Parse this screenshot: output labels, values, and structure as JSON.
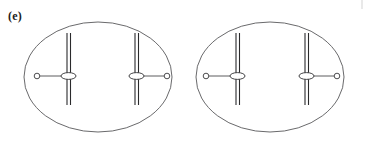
{
  "figure": {
    "panel_label": "(e)",
    "type": "biology-diagram",
    "canvas": {
      "width": 365,
      "height": 151,
      "background": "#ffffff"
    },
    "colors": {
      "membrane_stroke": "#58585a",
      "chromatid_stroke": "#2a2a2c",
      "spindle_stroke": "#4a4a4c",
      "centromere_fill": "#ffffff",
      "centromere_stroke": "#2f2f31",
      "centriole_fill": "#ffffff",
      "centriole_stroke": "#3a3a3c",
      "label_color": "#1b1b1b",
      "artifact_stroke": "#c8c8c8"
    },
    "cells": [
      {
        "name": "left-daughter-cell",
        "membrane": {
          "cx": 98,
          "cy": 77,
          "rx": 74,
          "ry": 55
        },
        "chromosomes": [
          {
            "name": "left-chromosome",
            "chromatids": [
              {
                "x": 67,
                "y1": 33,
                "y2": 105
              },
              {
                "x": 70.5,
                "y1": 33,
                "y2": 105
              }
            ],
            "centromere": {
              "cx": 68.5,
              "cy": 76,
              "rx": 7.5,
              "ry": 3.4
            },
            "spindle_fiber": {
              "x1": 40,
              "y1": 76,
              "x2": 61,
              "y2": 76
            },
            "centriole": {
              "cx": 37,
              "cy": 76,
              "r": 2.8
            }
          },
          {
            "name": "right-chromosome",
            "chromatids": [
              {
                "x": 135,
                "y1": 33,
                "y2": 105
              },
              {
                "x": 138.5,
                "y1": 33,
                "y2": 105
              }
            ],
            "centromere": {
              "cx": 136.5,
              "cy": 76,
              "rx": 7.5,
              "ry": 3.4
            },
            "spindle_fiber": {
              "x1": 144,
              "y1": 76,
              "x2": 164,
              "y2": 76
            },
            "centriole": {
              "cx": 167,
              "cy": 76,
              "r": 2.8
            }
          }
        ]
      },
      {
        "name": "right-daughter-cell",
        "membrane": {
          "cx": 270,
          "cy": 77,
          "rx": 74,
          "ry": 55
        },
        "chromosomes": [
          {
            "name": "left-chromosome",
            "chromatids": [
              {
                "x": 236,
                "y1": 33,
                "y2": 105
              },
              {
                "x": 239.5,
                "y1": 33,
                "y2": 105
              }
            ],
            "centromere": {
              "cx": 237.5,
              "cy": 76,
              "rx": 7.5,
              "ry": 3.4
            },
            "spindle_fiber": {
              "x1": 209,
              "y1": 76,
              "x2": 230,
              "y2": 76
            },
            "centriole": {
              "cx": 206,
              "cy": 76,
              "r": 2.8
            }
          },
          {
            "name": "right-chromosome",
            "chromatids": [
              {
                "x": 305,
                "y1": 33,
                "y2": 105
              },
              {
                "x": 308.5,
                "y1": 33,
                "y2": 105
              }
            ],
            "centromere": {
              "cx": 306.5,
              "cy": 76,
              "rx": 7.5,
              "ry": 3.4
            },
            "spindle_fiber": {
              "x1": 314,
              "y1": 76,
              "x2": 334,
              "y2": 76
            },
            "centriole": {
              "cx": 337,
              "cy": 76,
              "r": 2.8
            }
          }
        ]
      }
    ],
    "edge_artifact": {
      "x1": 362,
      "y1": 0,
      "x2": 362,
      "y2": 9
    }
  }
}
